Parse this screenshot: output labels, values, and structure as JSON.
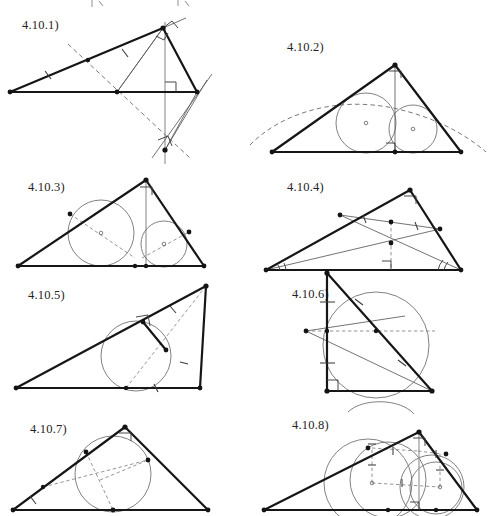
{
  "page": {
    "kind": "geometry-figure-sheet",
    "width": 493,
    "height": 516,
    "background": "#ffffff",
    "ink": "#161616",
    "light_ink": "#6a6a6a",
    "columns": 2,
    "rows": 4,
    "figure_count": 8
  },
  "figures": [
    {
      "id": "4.10.1",
      "label": "4.10.1)",
      "label_x": 22,
      "label_y": 18,
      "caption_note": "obtuse triangle with altitude, median-like cevian, right-angle marks and dashed perpendicular bisector extended below",
      "elements": [
        "triangle-outline",
        "altitude-vertical-gray",
        "right-angle-mark-at-foot",
        "right-angle-mark-at-apex",
        "tick-marks-on-left-side",
        "dashed-perpendicular-bisector",
        "lower-intersection-point",
        "extension-rays"
      ]
    },
    {
      "id": "4.10.2",
      "label": "4.10.2)",
      "label_x": 287,
      "label_y": 40,
      "caption_note": "triangle with altitude from apex to base, two inscribed circles tangent to the altitude, dashed arc through both centers",
      "elements": [
        "triangle-outline",
        "altitude-from-apex",
        "right-angle-mark-at-apex",
        "right-angle-mark-at-base",
        "incircle-left",
        "incircle-right",
        "circle-center-left",
        "circle-center-right",
        "dashed-arc-through-centers"
      ]
    },
    {
      "id": "4.10.3",
      "label": "4.10.3)",
      "label_x": 28,
      "label_y": 180,
      "caption_note": "triangle with altitude and two incircles, dashed diameters drawn through each centre toward the tangency points",
      "elements": [
        "triangle-outline",
        "altitude-gray",
        "right-angle-mark-at-apex",
        "incircle-left",
        "incircle-right",
        "dashed-diameter-left",
        "dashed-diameter-right",
        "tangency-dots"
      ]
    },
    {
      "id": "4.10.4",
      "label": "4.10.4)",
      "label_x": 287,
      "label_y": 180,
      "caption_note": "triangle with two cevians from the base vertices, a midsegment with equal tick marks, dashed vertical to base and right-angle mark, double angle arcs at both base corners",
      "elements": [
        "triangle-outline",
        "right-angle-mark-at-apex",
        "cevian-from-left-vertex",
        "cevian-from-right-vertex",
        "midsegment-with-ticks",
        "dashed-vertical-to-base",
        "right-angle-mark-at-base",
        "angle-arcs-left",
        "angle-arcs-right"
      ]
    },
    {
      "id": "4.10.5",
      "label": "4.10.5)",
      "label_x": 28,
      "label_y": 288,
      "caption_note": "triangle with an inscribed circle, a short segment from the upper side making a right angle, dashed cevian from the far apex through the circle to the base",
      "elements": [
        "triangle-outline",
        "incircle",
        "right-angle-mark-on-upper-side",
        "short-perpendicular-segment",
        "dashed-cevian",
        "tick-marks-upper-side",
        "tick-marks-right-side",
        "tick-mark-base"
      ]
    },
    {
      "id": "4.10.6",
      "label": "4.10.6)",
      "label_x": 292,
      "label_y": 287,
      "caption_note": "right triangle with circumscribed circle through the hypotenuse, a dashed horizontal chord, an external point to the left joined by thin lines, tick marks on the vertical leg and hypotenuse",
      "elements": [
        "right-triangle-outline",
        "right-angle-mark-at-corner",
        "circumscribed-circle",
        "dashed-horizontal-chord",
        "external-point-left",
        "thin-connector-lines",
        "tangent-line-upper",
        "tick-marks-vertical-leg",
        "tick-marks-hypotenuse"
      ]
    },
    {
      "id": "4.10.7",
      "label": "4.10.7)",
      "label_x": 30,
      "label_y": 422,
      "caption_note": "triangle with inscribed circle, dashed chords joining the tangency points, right-angle mark at the apex, tick marks on the left side",
      "elements": [
        "triangle-outline",
        "incircle",
        "right-angle-mark-at-apex",
        "dashed-chord-a",
        "dashed-chord-b",
        "dashed-chord-c",
        "tangency-dots",
        "tick-marks-left-side"
      ]
    },
    {
      "id": "4.10.8",
      "label": "4.10.8)",
      "label_x": 292,
      "label_y": 418,
      "caption_note": "triangle with altitude, two incircles plus two larger circles, dashed radius and centre lines with equal tick marks labelled with hatch strokes",
      "elements": [
        "triangle-outline",
        "altitude-gray",
        "right-angle-mark-at-apex",
        "right-angle-mark-at-base",
        "incircle-left",
        "incircle-right",
        "large-circle-left",
        "large-circle-right",
        "dashed-centre-line",
        "dashed-radius-left",
        "dashed-radius-right",
        "tick-hatch-marks"
      ]
    }
  ],
  "top_artifacts": {
    "note": "faint cropped strokes from the figure above the page crop",
    "present": true
  }
}
